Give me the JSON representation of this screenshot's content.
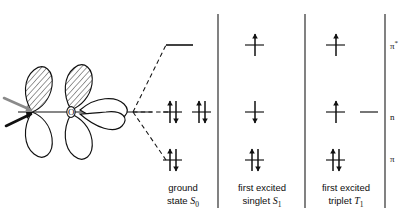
{
  "figure": {
    "kind": "molecular-orbital-state-diagram",
    "atom_label": "O",
    "ink_color": "#111111",
    "pointer_gray": "#8a8a8a",
    "background": "#ffffff"
  },
  "orbital_drawing": {
    "pointer_arrows": [
      "lone-pair-pointer-gray",
      "lone-pair-pointer-black"
    ],
    "lobes": [
      "shaded-p-lobe-left",
      "shaded-p-lobe-center",
      "open-p-lobe-right"
    ]
  },
  "levels": [
    {
      "key": "pi_star",
      "label": "π",
      "superscript": "*",
      "y": 45
    },
    {
      "key": "n",
      "label": "n",
      "superscript": "",
      "y": 118
    },
    {
      "key": "pi",
      "label": "π",
      "superscript": "",
      "y": 160
    }
  ],
  "states": [
    {
      "key": "ground",
      "caption_line1": "ground",
      "caption_line2": "state",
      "term": "S",
      "term_sub": "0",
      "occupancy": {
        "pi_star": "empty",
        "n": "paired",
        "pi": "paired"
      }
    },
    {
      "key": "singlet",
      "caption_line1": "first excited",
      "caption_line2": "singlet",
      "term": "S",
      "term_sub": "1",
      "occupancy": {
        "pi_star": "single-up",
        "n": "single-down",
        "pi": "paired"
      }
    },
    {
      "key": "triplet",
      "caption_line1": "first excited",
      "caption_line2": "triplet",
      "term": "T",
      "term_sub": "1",
      "occupancy": {
        "pi_star": "single-up",
        "n": "single-up",
        "pi": "paired"
      }
    }
  ]
}
